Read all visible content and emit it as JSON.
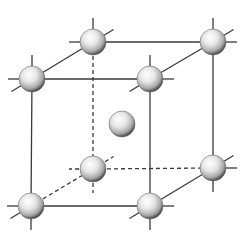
{
  "diagram": {
    "type": "body-centered-cubic-unit-cell",
    "colors": {
      "line": "#3a3a3a",
      "atom_highlight": "#ffffff",
      "atom_mid": "#dcdcdc",
      "atom_shadow": "#5a5a5a"
    },
    "atom_radius": 13,
    "atoms": [
      {
        "id": "back-top-left",
        "x": 93,
        "y": 42,
        "layer": "back"
      },
      {
        "id": "back-top-right",
        "x": 213,
        "y": 42,
        "layer": "back"
      },
      {
        "id": "back-bottom-left",
        "x": 93,
        "y": 169,
        "layer": "back"
      },
      {
        "id": "back-bottom-right",
        "x": 213,
        "y": 168,
        "layer": "back"
      },
      {
        "id": "center",
        "x": 122,
        "y": 124,
        "layer": "center"
      },
      {
        "id": "front-top-left",
        "x": 32,
        "y": 79,
        "layer": "front"
      },
      {
        "id": "front-top-right",
        "x": 150,
        "y": 79,
        "layer": "front"
      },
      {
        "id": "front-bottom-left",
        "x": 31,
        "y": 206,
        "layer": "front"
      },
      {
        "id": "front-bottom-right",
        "x": 150,
        "y": 206,
        "layer": "front"
      }
    ],
    "edges": [
      {
        "from": "front-top-left",
        "to": "front-top-right",
        "style": "solid"
      },
      {
        "from": "front-top-left",
        "to": "front-bottom-left",
        "style": "solid"
      },
      {
        "from": "front-bottom-left",
        "to": "front-bottom-right",
        "style": "solid"
      },
      {
        "from": "front-top-right",
        "to": "front-bottom-right",
        "style": "solid"
      },
      {
        "from": "front-top-left",
        "to": "back-top-left",
        "style": "solid"
      },
      {
        "from": "front-top-right",
        "to": "back-top-right",
        "style": "solid"
      },
      {
        "from": "back-top-left",
        "to": "back-top-right",
        "style": "solid"
      },
      {
        "from": "back-top-right",
        "to": "back-bottom-right",
        "style": "solid"
      },
      {
        "from": "front-bottom-right",
        "to": "back-bottom-right",
        "style": "solid"
      },
      {
        "from": "back-top-left",
        "to": "back-bottom-left",
        "style": "dashed"
      },
      {
        "from": "back-bottom-left",
        "to": "back-bottom-right",
        "style": "dashed"
      },
      {
        "from": "front-bottom-left",
        "to": "back-bottom-left",
        "style": "dashed"
      }
    ]
  }
}
